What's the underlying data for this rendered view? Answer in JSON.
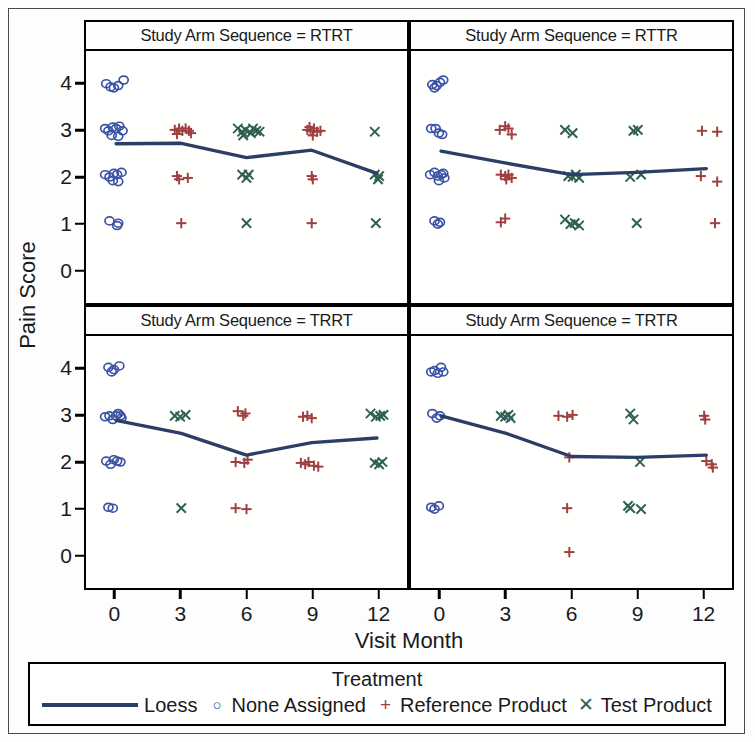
{
  "axes": {
    "y_title": "Pain Score",
    "x_title": "Visit Month",
    "y_ticks": [
      "4",
      "3",
      "2",
      "1",
      "0"
    ],
    "x_ticks": [
      "0",
      "3",
      "6",
      "9",
      "12"
    ]
  },
  "legend": {
    "title": "Treatment",
    "items": [
      {
        "label": "Loess",
        "marker": "line",
        "color": "#2c3e66"
      },
      {
        "label": "None Assigned",
        "marker": "circle-open-icon",
        "glyph": "○",
        "color": "#3b52a6"
      },
      {
        "label": "Reference Product",
        "marker": "plus-icon",
        "glyph": "+",
        "color": "#a03f3f"
      },
      {
        "label": "Test Product",
        "marker": "cross-icon",
        "glyph": "✕",
        "color": "#2f6054"
      }
    ]
  },
  "panels": [
    {
      "id": "tl",
      "title": "Study Arm Sequence = RTRT"
    },
    {
      "id": "tr",
      "title": "Study Arm Sequence = RTTR"
    },
    {
      "id": "bl",
      "title": "Study Arm Sequence = TRRT"
    },
    {
      "id": "br",
      "title": "Study Arm Sequence = TRTR"
    }
  ],
  "chart_data": {
    "type": "scatter",
    "xlabel": "Visit Month",
    "ylabel": "Pain Score",
    "xlim": [
      -1.2,
      13.2
    ],
    "ylim": [
      -0.6,
      4.6
    ],
    "xticks": [
      0,
      3,
      6,
      9,
      12
    ],
    "yticks": [
      0,
      1,
      2,
      3,
      4
    ],
    "grid": false,
    "legend_position": "bottom",
    "facet_variable": "Study Arm Sequence",
    "series_colors": {
      "Loess": "#2c3e66",
      "None Assigned": "#3b52a6",
      "Reference Product": "#a03f3f",
      "Test Product": "#2f6054"
    },
    "panels": [
      {
        "facet": "RTRT",
        "points": {
          "None Assigned": [
            [
              -0.45,
              4.02
            ],
            [
              -0.25,
              3.95
            ],
            [
              -0.1,
              3.93
            ],
            [
              0.1,
              3.98
            ],
            [
              0.35,
              4.1
            ],
            [
              -0.5,
              3.05
            ],
            [
              -0.35,
              3.0
            ],
            [
              -0.15,
              3.08
            ],
            [
              0.0,
              3.05
            ],
            [
              0.15,
              3.1
            ],
            [
              0.3,
              3.0
            ],
            [
              0.1,
              2.88
            ],
            [
              -0.2,
              2.9
            ],
            [
              -0.5,
              2.05
            ],
            [
              -0.3,
              2.0
            ],
            [
              -0.1,
              2.08
            ],
            [
              0.05,
              2.05
            ],
            [
              0.25,
              2.1
            ],
            [
              0.1,
              1.9
            ],
            [
              -0.15,
              1.92
            ],
            [
              -0.3,
              1.05
            ],
            [
              0.05,
              0.95
            ],
            [
              0.1,
              1.0
            ]
          ],
          "Reference Product": [
            [
              2.7,
              3.02
            ],
            [
              2.9,
              3.05
            ],
            [
              3.05,
              3.0
            ],
            [
              3.2,
              3.05
            ],
            [
              3.45,
              2.95
            ],
            [
              2.8,
              2.93
            ],
            [
              3.35,
              3.0
            ],
            [
              2.8,
              2.02
            ],
            [
              2.9,
              1.95
            ],
            [
              3.3,
              1.98
            ],
            [
              3.0,
              1.0
            ],
            [
              8.8,
              3.02
            ],
            [
              8.95,
              3.0
            ],
            [
              9.1,
              3.05
            ],
            [
              9.25,
              2.98
            ],
            [
              9.4,
              3.0
            ],
            [
              9.05,
              2.9
            ],
            [
              8.9,
              3.08
            ],
            [
              9.0,
              2.02
            ],
            [
              9.05,
              1.95
            ],
            [
              9.0,
              1.0
            ]
          ],
          "Test Product": [
            [
              5.6,
              3.05
            ],
            [
              5.8,
              2.98
            ],
            [
              5.95,
              3.02
            ],
            [
              6.2,
              2.95
            ],
            [
              6.45,
              3.0
            ],
            [
              6.6,
              2.98
            ],
            [
              5.85,
              2.9
            ],
            [
              6.3,
              3.05
            ],
            [
              5.8,
              2.05
            ],
            [
              6.0,
              1.98
            ],
            [
              6.1,
              2.05
            ],
            [
              6.0,
              1.0
            ],
            [
              11.9,
              2.98
            ],
            [
              11.9,
              2.05
            ],
            [
              12.05,
              1.95
            ],
            [
              12.1,
              2.02
            ],
            [
              11.95,
              1.0
            ]
          ]
        },
        "loess": [
          [
            0.0,
            2.72
          ],
          [
            3.0,
            2.73
          ],
          [
            6.0,
            2.42
          ],
          [
            9.0,
            2.58
          ],
          [
            12.0,
            2.08
          ]
        ]
      },
      {
        "facet": "RTTR",
        "points": {
          "None Assigned": [
            [
              -0.4,
              4.0
            ],
            [
              -0.2,
              3.98
            ],
            [
              -0.05,
              4.05
            ],
            [
              0.1,
              4.1
            ],
            [
              -0.3,
              3.93
            ],
            [
              -0.45,
              3.05
            ],
            [
              -0.25,
              3.05
            ],
            [
              -0.1,
              2.95
            ],
            [
              0.05,
              2.92
            ],
            [
              -0.5,
              2.05
            ],
            [
              -0.3,
              2.1
            ],
            [
              -0.15,
              2.02
            ],
            [
              0.0,
              2.05
            ],
            [
              0.15,
              1.98
            ],
            [
              -0.1,
              1.92
            ],
            [
              0.1,
              2.08
            ],
            [
              -0.3,
              1.05
            ],
            [
              -0.15,
              0.98
            ],
            [
              -0.05,
              1.02
            ]
          ],
          "Reference Product": [
            [
              2.7,
              3.02
            ],
            [
              2.95,
              3.1
            ],
            [
              3.1,
              3.05
            ],
            [
              3.25,
              2.92
            ],
            [
              2.75,
              2.05
            ],
            [
              2.95,
              2.02
            ],
            [
              3.1,
              2.05
            ],
            [
              3.25,
              1.98
            ],
            [
              3.0,
              1.95
            ],
            [
              2.75,
              1.02
            ],
            [
              2.95,
              1.1
            ],
            [
              12.0,
              3.0
            ],
            [
              12.7,
              2.98
            ],
            [
              11.95,
              2.02
            ],
            [
              12.7,
              1.9
            ],
            [
              12.6,
              1.0
            ]
          ],
          "Test Product": [
            [
              5.7,
              3.02
            ],
            [
              6.05,
              2.95
            ],
            [
              5.85,
              2.02
            ],
            [
              6.05,
              2.0
            ],
            [
              6.2,
              2.05
            ],
            [
              6.35,
              1.98
            ],
            [
              5.7,
              1.08
            ],
            [
              5.95,
              0.98
            ],
            [
              6.15,
              1.0
            ],
            [
              6.35,
              0.95
            ],
            [
              8.85,
              3.0
            ],
            [
              9.05,
              3.02
            ],
            [
              8.7,
              2.0
            ],
            [
              9.2,
              2.05
            ],
            [
              9.0,
              1.0
            ]
          ]
        },
        "loess": [
          [
            0.0,
            2.56
          ],
          [
            3.0,
            2.3
          ],
          [
            6.0,
            2.05
          ],
          [
            9.0,
            2.1
          ],
          [
            12.2,
            2.18
          ]
        ]
      },
      {
        "facet": "TRRT",
        "points": {
          "None Assigned": [
            [
              -0.35,
              4.05
            ],
            [
              -0.2,
              3.95
            ],
            [
              -0.1,
              4.0
            ],
            [
              0.15,
              4.08
            ],
            [
              -0.5,
              2.98
            ],
            [
              -0.3,
              3.0
            ],
            [
              -0.15,
              2.92
            ],
            [
              0.0,
              3.0
            ],
            [
              0.1,
              3.05
            ],
            [
              0.2,
              3.0
            ],
            [
              0.25,
              2.95
            ],
            [
              -0.45,
              2.02
            ],
            [
              -0.25,
              1.95
            ],
            [
              -0.1,
              2.05
            ],
            [
              0.05,
              2.02
            ],
            [
              0.2,
              2.0
            ],
            [
              -0.35,
              1.02
            ],
            [
              -0.15,
              1.0
            ]
          ],
          "Reference Product": [
            [
              5.6,
              3.1
            ],
            [
              5.85,
              3.0
            ],
            [
              5.95,
              3.05
            ],
            [
              5.5,
              2.0
            ],
            [
              5.9,
              1.98
            ],
            [
              6.05,
              2.05
            ],
            [
              5.5,
              1.0
            ],
            [
              6.0,
              0.98
            ],
            [
              8.6,
              2.98
            ],
            [
              8.8,
              3.0
            ],
            [
              9.0,
              2.95
            ],
            [
              8.5,
              1.98
            ],
            [
              8.7,
              1.95
            ],
            [
              8.85,
              2.0
            ],
            [
              9.1,
              1.92
            ],
            [
              9.3,
              1.9
            ]
          ],
          "Test Product": [
            [
              2.7,
              3.0
            ],
            [
              2.95,
              2.98
            ],
            [
              3.2,
              3.02
            ],
            [
              3.0,
              1.0
            ],
            [
              11.7,
              3.05
            ],
            [
              11.95,
              2.98
            ],
            [
              12.15,
              3.0
            ],
            [
              12.3,
              3.02
            ],
            [
              11.9,
              1.98
            ],
            [
              12.1,
              1.95
            ],
            [
              12.25,
              2.0
            ]
          ]
        },
        "loess": [
          [
            0.0,
            2.9
          ],
          [
            3.0,
            2.62
          ],
          [
            6.0,
            2.15
          ],
          [
            9.0,
            2.42
          ],
          [
            12.0,
            2.52
          ]
        ]
      },
      {
        "facet": "TRTR",
        "points": {
          "None Assigned": [
            [
              -0.45,
              3.95
            ],
            [
              -0.3,
              3.98
            ],
            [
              -0.15,
              3.92
            ],
            [
              0.0,
              4.05
            ],
            [
              0.1,
              3.95
            ],
            [
              -0.4,
              3.05
            ],
            [
              -0.2,
              2.95
            ],
            [
              -0.05,
              3.0
            ],
            [
              -0.45,
              1.02
            ],
            [
              -0.3,
              0.98
            ],
            [
              -0.1,
              1.05
            ]
          ],
          "Reference Product": [
            [
              5.4,
              3.0
            ],
            [
              5.8,
              2.98
            ],
            [
              6.05,
              3.02
            ],
            [
              5.9,
              2.1
            ],
            [
              5.8,
              1.0
            ],
            [
              5.9,
              0.05
            ],
            [
              12.1,
              3.0
            ],
            [
              12.15,
              2.92
            ],
            [
              12.2,
              2.02
            ],
            [
              12.45,
              1.95
            ],
            [
              12.5,
              1.88
            ]
          ],
          "Test Product": [
            [
              2.75,
              3.0
            ],
            [
              2.95,
              2.98
            ],
            [
              3.1,
              3.02
            ],
            [
              3.2,
              2.95
            ],
            [
              8.7,
              3.05
            ],
            [
              8.85,
              2.92
            ],
            [
              9.15,
              2.0
            ],
            [
              8.6,
              1.05
            ],
            [
              8.7,
              1.0
            ],
            [
              9.2,
              0.98
            ]
          ]
        },
        "loess": [
          [
            0.0,
            3.0
          ],
          [
            3.0,
            2.62
          ],
          [
            6.0,
            2.12
          ],
          [
            9.0,
            2.1
          ],
          [
            12.2,
            2.15
          ]
        ]
      }
    ]
  }
}
